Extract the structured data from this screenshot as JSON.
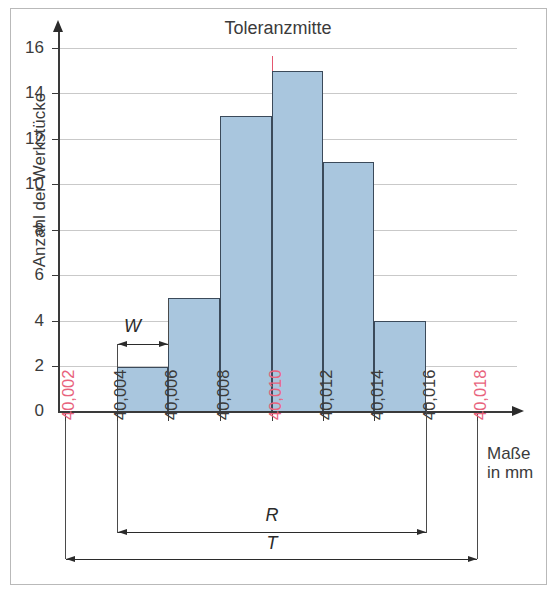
{
  "chart_data": {
    "type": "bar",
    "title": "Toleranzmitte",
    "xlabel": "Maße in mm",
    "ylabel": "Anzahl der Werkstücke",
    "ylim": [
      0,
      16
    ],
    "grid": true,
    "legend": "none",
    "x_tick_labels": [
      "40,002",
      "40,004",
      "40,006",
      "40,008",
      "40,010",
      "40,012",
      "40,014",
      "40,016",
      "40,018"
    ],
    "x_tick_colors": [
      "#e8637d",
      "#3b3b3b",
      "#3b3b3b",
      "#3b3b3b",
      "#e8637d",
      "#3b3b3b",
      "#3b3b3b",
      "#3b3b3b",
      "#e8637d"
    ],
    "y_tick_labels": [
      "0",
      "2",
      "4",
      "6",
      "8",
      "10",
      "12",
      "14",
      "16"
    ],
    "y_ticks": [
      0,
      2,
      4,
      6,
      8,
      10,
      12,
      14,
      16
    ],
    "bin_edges": [
      "40,004",
      "40,006",
      "40,008",
      "40,010",
      "40,012",
      "40,014",
      "40,016"
    ],
    "categories": [
      "40,004–40,006",
      "40,006–40,008",
      "40,008–40,010",
      "40,010–40,012",
      "40,012–40,014",
      "40,014–40,016"
    ],
    "values": [
      2,
      5,
      13,
      15,
      11,
      4
    ],
    "annotations": {
      "center_mark_label": "Toleranzmitte",
      "center_mark_value": "40,010",
      "center_mark_color": "#e4576f",
      "bin_width_symbol": "W",
      "range_symbol": "R",
      "tolerance_symbol": "T",
      "range_from": "40,004",
      "range_to": "40,016",
      "tolerance_from": "40,002",
      "tolerance_to": "40,018"
    },
    "colors": {
      "bar_fill": "#a9c6de",
      "bar_stroke": "#3b4a5a",
      "axis": "#3a3a3a",
      "grid": "#c9c9c9",
      "highlight": "#e8637d",
      "text": "#3b3b3b",
      "frame": "#b9b9b9"
    },
    "unit_label_lines": [
      "Maße",
      "in mm"
    ]
  }
}
